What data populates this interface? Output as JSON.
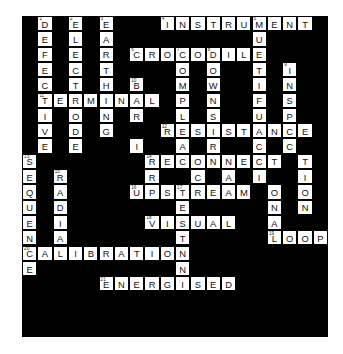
{
  "puzzle": {
    "type": "crossword",
    "grid_columns": 20,
    "grid_rows": 21,
    "cell_size_px": 15.3,
    "origin": {
      "x": 22,
      "y": 16
    },
    "colors": {
      "block": "#000000",
      "cell_fill": "#ffffff",
      "cell_border": "#000000",
      "letter": "#111111",
      "page_background": "#ffffff"
    },
    "answers": [
      {
        "number": 1,
        "text": "DEFECTIVE",
        "direction": "down"
      },
      {
        "number": 2,
        "text": "ELECTRODE",
        "direction": "down"
      },
      {
        "number": 3,
        "text": "EARTHING",
        "direction": "down"
      },
      {
        "number": 4,
        "text": "INSTRUMENT",
        "direction": "across"
      },
      {
        "number": 5,
        "text": "MULTIMETER",
        "direction": "down"
      },
      {
        "number": 6,
        "text": "CROCODILE",
        "direction": "across"
      },
      {
        "number": 7,
        "text": "COMPLIANCE",
        "direction": "down"
      },
      {
        "number": 8,
        "text": "DOWNSTREAM",
        "direction": "down"
      },
      {
        "number": 9,
        "text": "INSPECTION",
        "direction": "down"
      },
      {
        "number": 10,
        "text": "BARRIER",
        "direction": "down"
      },
      {
        "number": 11,
        "text": "TERMINAL",
        "direction": "across"
      },
      {
        "number": 12,
        "text": "RESISTANCE",
        "direction": "across"
      },
      {
        "number": 13,
        "text": "SEQUENCE",
        "direction": "down"
      },
      {
        "number": 14,
        "text": "RECONNECT",
        "direction": "across"
      },
      {
        "number": 15,
        "text": "RADIAL",
        "direction": "down"
      },
      {
        "number": 16,
        "text": "UPSTREAM",
        "direction": "across"
      },
      {
        "number": 17,
        "text": "TESTN",
        "direction": "down"
      },
      {
        "number": 18,
        "text": "VISUAL",
        "direction": "across"
      },
      {
        "number": 19,
        "text": "LOOP",
        "direction": "across"
      },
      {
        "number": 20,
        "text": "CALIBRATION",
        "direction": "across"
      },
      {
        "number": 21,
        "text": "ENERGISED",
        "direction": "across"
      }
    ],
    "cells": [
      {
        "r": 0,
        "c": 1,
        "l": "D",
        "n": "1"
      },
      {
        "r": 0,
        "c": 3,
        "l": "E",
        "n": "2"
      },
      {
        "r": 0,
        "c": 5,
        "l": "E",
        "n": "3"
      },
      {
        "r": 0,
        "c": 9,
        "l": "I",
        "n": "4"
      },
      {
        "r": 0,
        "c": 10,
        "l": "N"
      },
      {
        "r": 0,
        "c": 11,
        "l": "S"
      },
      {
        "r": 0,
        "c": 12,
        "l": "T"
      },
      {
        "r": 0,
        "c": 13,
        "l": "R"
      },
      {
        "r": 0,
        "c": 14,
        "l": "U"
      },
      {
        "r": 0,
        "c": 15,
        "l": "M",
        "n": "5"
      },
      {
        "r": 0,
        "c": 16,
        "l": "E"
      },
      {
        "r": 0,
        "c": 17,
        "l": "N"
      },
      {
        "r": 0,
        "c": 18,
        "l": "T"
      },
      {
        "r": 1,
        "c": 1,
        "l": "E"
      },
      {
        "r": 1,
        "c": 3,
        "l": "L"
      },
      {
        "r": 1,
        "c": 5,
        "l": "A"
      },
      {
        "r": 1,
        "c": 15,
        "l": "U"
      },
      {
        "r": 2,
        "c": 1,
        "l": "F"
      },
      {
        "r": 2,
        "c": 3,
        "l": "E"
      },
      {
        "r": 2,
        "c": 5,
        "l": "R"
      },
      {
        "r": 2,
        "c": 7,
        "l": "C",
        "n": "6"
      },
      {
        "r": 2,
        "c": 8,
        "l": "R"
      },
      {
        "r": 2,
        "c": 9,
        "l": "O"
      },
      {
        "r": 2,
        "c": 10,
        "l": "C",
        "n": "7"
      },
      {
        "r": 2,
        "c": 11,
        "l": "O"
      },
      {
        "r": 2,
        "c": 12,
        "l": "D",
        "n": "8"
      },
      {
        "r": 2,
        "c": 13,
        "l": "I"
      },
      {
        "r": 2,
        "c": 14,
        "l": "L"
      },
      {
        "r": 2,
        "c": 15,
        "l": "E"
      },
      {
        "r": 3,
        "c": 1,
        "l": "E"
      },
      {
        "r": 3,
        "c": 3,
        "l": "C"
      },
      {
        "r": 3,
        "c": 5,
        "l": "T"
      },
      {
        "r": 3,
        "c": 10,
        "l": "O"
      },
      {
        "r": 3,
        "c": 12,
        "l": "O"
      },
      {
        "r": 3,
        "c": 15,
        "l": "T"
      },
      {
        "r": 3,
        "c": 17,
        "l": "I",
        "n": "9"
      },
      {
        "r": 4,
        "c": 1,
        "l": "C"
      },
      {
        "r": 4,
        "c": 3,
        "l": "T"
      },
      {
        "r": 4,
        "c": 5,
        "l": "H"
      },
      {
        "r": 4,
        "c": 7,
        "l": "B",
        "n": "10"
      },
      {
        "r": 4,
        "c": 10,
        "l": "M"
      },
      {
        "r": 4,
        "c": 12,
        "l": "W"
      },
      {
        "r": 4,
        "c": 15,
        "l": "I"
      },
      {
        "r": 4,
        "c": 17,
        "l": "N"
      },
      {
        "r": 5,
        "c": 1,
        "l": "T",
        "n": "11"
      },
      {
        "r": 5,
        "c": 2,
        "l": "E"
      },
      {
        "r": 5,
        "c": 3,
        "l": "R"
      },
      {
        "r": 5,
        "c": 4,
        "l": "M"
      },
      {
        "r": 5,
        "c": 5,
        "l": "I"
      },
      {
        "r": 5,
        "c": 6,
        "l": "N"
      },
      {
        "r": 5,
        "c": 7,
        "l": "A"
      },
      {
        "r": 5,
        "c": 8,
        "l": "L"
      },
      {
        "r": 5,
        "c": 10,
        "l": "P"
      },
      {
        "r": 5,
        "c": 12,
        "l": "N"
      },
      {
        "r": 5,
        "c": 15,
        "l": "F"
      },
      {
        "r": 5,
        "c": 17,
        "l": "S"
      },
      {
        "r": 6,
        "c": 1,
        "l": "I"
      },
      {
        "r": 6,
        "c": 3,
        "l": "O"
      },
      {
        "r": 6,
        "c": 5,
        "l": "N"
      },
      {
        "r": 6,
        "c": 7,
        "l": "R"
      },
      {
        "r": 6,
        "c": 10,
        "l": "L"
      },
      {
        "r": 6,
        "c": 12,
        "l": "S"
      },
      {
        "r": 6,
        "c": 15,
        "l": "U"
      },
      {
        "r": 6,
        "c": 17,
        "l": "P"
      },
      {
        "r": 7,
        "c": 1,
        "l": "V"
      },
      {
        "r": 7,
        "c": 3,
        "l": "D"
      },
      {
        "r": 7,
        "c": 5,
        "l": "G"
      },
      {
        "r": 7,
        "c": 9,
        "l": "R",
        "n": "12"
      },
      {
        "r": 7,
        "c": 10,
        "l": "E"
      },
      {
        "r": 7,
        "c": 11,
        "l": "S"
      },
      {
        "r": 7,
        "c": 12,
        "l": "I"
      },
      {
        "r": 7,
        "c": 13,
        "l": "S"
      },
      {
        "r": 7,
        "c": 14,
        "l": "T"
      },
      {
        "r": 7,
        "c": 15,
        "l": "A"
      },
      {
        "r": 7,
        "c": 16,
        "l": "N"
      },
      {
        "r": 7,
        "c": 17,
        "l": "C"
      },
      {
        "r": 7,
        "c": 18,
        "l": "E"
      },
      {
        "r": 8,
        "c": 1,
        "l": "E"
      },
      {
        "r": 8,
        "c": 3,
        "l": "E"
      },
      {
        "r": 8,
        "c": 7,
        "l": "I"
      },
      {
        "r": 8,
        "c": 10,
        "l": "A"
      },
      {
        "r": 8,
        "c": 12,
        "l": "R"
      },
      {
        "r": 8,
        "c": 15,
        "l": "C"
      },
      {
        "r": 8,
        "c": 17,
        "l": "C"
      },
      {
        "r": 9,
        "c": 0,
        "l": "S",
        "n": "13"
      },
      {
        "r": 9,
        "c": 8,
        "l": "R",
        "n": "14"
      },
      {
        "r": 9,
        "c": 9,
        "l": "E"
      },
      {
        "r": 9,
        "c": 10,
        "l": "C"
      },
      {
        "r": 9,
        "c": 11,
        "l": "O"
      },
      {
        "r": 9,
        "c": 12,
        "l": "N"
      },
      {
        "r": 9,
        "c": 13,
        "l": "N"
      },
      {
        "r": 9,
        "c": 14,
        "l": "E"
      },
      {
        "r": 9,
        "c": 15,
        "l": "C"
      },
      {
        "r": 9,
        "c": 16,
        "l": "T"
      },
      {
        "r": 9,
        "c": 18,
        "l": "T"
      },
      {
        "r": 10,
        "c": 0,
        "l": "E"
      },
      {
        "r": 10,
        "c": 2,
        "l": "R",
        "n": "15"
      },
      {
        "r": 10,
        "c": 8,
        "l": "R"
      },
      {
        "r": 10,
        "c": 11,
        "l": "C"
      },
      {
        "r": 10,
        "c": 13,
        "l": "A"
      },
      {
        "r": 10,
        "c": 15,
        "l": "I"
      },
      {
        "r": 10,
        "c": 18,
        "l": "I"
      },
      {
        "r": 11,
        "c": 0,
        "l": "Q"
      },
      {
        "r": 11,
        "c": 2,
        "l": "A"
      },
      {
        "r": 11,
        "c": 7,
        "l": "U",
        "n": "16"
      },
      {
        "r": 11,
        "c": 8,
        "l": "P"
      },
      {
        "r": 11,
        "c": 9,
        "l": "S"
      },
      {
        "r": 11,
        "c": 10,
        "l": "T",
        "n": "17"
      },
      {
        "r": 11,
        "c": 11,
        "l": "R"
      },
      {
        "r": 11,
        "c": 12,
        "l": "E"
      },
      {
        "r": 11,
        "c": 13,
        "l": "A"
      },
      {
        "r": 11,
        "c": 14,
        "l": "M"
      },
      {
        "r": 11,
        "c": 16,
        "l": "O"
      },
      {
        "r": 11,
        "c": 18,
        "l": "O"
      },
      {
        "r": 12,
        "c": 0,
        "l": "U"
      },
      {
        "r": 12,
        "c": 2,
        "l": "D"
      },
      {
        "r": 12,
        "c": 10,
        "l": "E"
      },
      {
        "r": 12,
        "c": 16,
        "l": "N"
      },
      {
        "r": 12,
        "c": 18,
        "l": "N"
      },
      {
        "r": 13,
        "c": 0,
        "l": "E"
      },
      {
        "r": 13,
        "c": 2,
        "l": "I"
      },
      {
        "r": 13,
        "c": 8,
        "l": "V",
        "n": "18"
      },
      {
        "r": 13,
        "c": 9,
        "l": "I"
      },
      {
        "r": 13,
        "c": 10,
        "l": "S"
      },
      {
        "r": 13,
        "c": 11,
        "l": "U"
      },
      {
        "r": 13,
        "c": 12,
        "l": "A"
      },
      {
        "r": 13,
        "c": 13,
        "l": "L"
      },
      {
        "r": 13,
        "c": 16,
        "l": "A"
      },
      {
        "r": 14,
        "c": 0,
        "l": "N"
      },
      {
        "r": 14,
        "c": 2,
        "l": "A"
      },
      {
        "r": 14,
        "c": 10,
        "l": "T"
      },
      {
        "r": 14,
        "c": 16,
        "l": "L",
        "n": "19"
      },
      {
        "r": 14,
        "c": 17,
        "l": "O"
      },
      {
        "r": 14,
        "c": 18,
        "l": "O"
      },
      {
        "r": 14,
        "c": 19,
        "l": "P"
      },
      {
        "r": 15,
        "c": 0,
        "l": "C",
        "n": "20"
      },
      {
        "r": 15,
        "c": 1,
        "l": "A"
      },
      {
        "r": 15,
        "c": 2,
        "l": "L"
      },
      {
        "r": 15,
        "c": 3,
        "l": "I"
      },
      {
        "r": 15,
        "c": 4,
        "l": "B"
      },
      {
        "r": 15,
        "c": 5,
        "l": "R"
      },
      {
        "r": 15,
        "c": 6,
        "l": "A"
      },
      {
        "r": 15,
        "c": 7,
        "l": "T"
      },
      {
        "r": 15,
        "c": 8,
        "l": "I"
      },
      {
        "r": 15,
        "c": 9,
        "l": "O"
      },
      {
        "r": 15,
        "c": 10,
        "l": "N"
      },
      {
        "r": 16,
        "c": 0,
        "l": "E"
      },
      {
        "r": 16,
        "c": 10,
        "l": "N"
      },
      {
        "r": 17,
        "c": 5,
        "l": "E",
        "n": "21"
      },
      {
        "r": 17,
        "c": 6,
        "l": "N"
      },
      {
        "r": 17,
        "c": 7,
        "l": "E"
      },
      {
        "r": 17,
        "c": 8,
        "l": "R"
      },
      {
        "r": 17,
        "c": 9,
        "l": "G"
      },
      {
        "r": 17,
        "c": 10,
        "l": "I"
      },
      {
        "r": 17,
        "c": 11,
        "l": "S"
      },
      {
        "r": 17,
        "c": 12,
        "l": "E"
      },
      {
        "r": 17,
        "c": 13,
        "l": "D"
      }
    ]
  }
}
